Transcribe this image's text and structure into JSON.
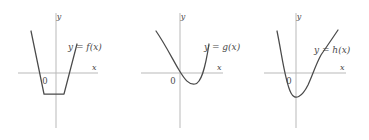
{
  "figure": {
    "name": "three-function-graphs",
    "background_color": "#ffffff",
    "axis_color": "#b9b9b9",
    "curve_color": "#4a4a4a",
    "panels": [
      {
        "id": "f",
        "function_label": "y = f(x)",
        "y_axis_label": "y",
        "x_axis_label": "x",
        "origin_label": "0",
        "curve_type": "piecewise-linear",
        "description": "Trapezoid-shaped piecewise linear graph: steep line descending from upper left to a flat horizontal segment below the x-axis, then rising steeply to the upper right.",
        "vertices": [
          {
            "x": -2.45,
            "y": 2.55
          },
          {
            "x": -1.05,
            "y": -1.35
          },
          {
            "x": 0.95,
            "y": -1.35
          },
          {
            "x": 2.2,
            "y": 1.75
          }
        ],
        "x_intercepts": [
          -1.55,
          1.45
        ],
        "minimum": {
          "x": -0.05,
          "y": -1.35
        }
      },
      {
        "id": "g",
        "function_label": "y = g(x)",
        "y_axis_label": "y",
        "x_axis_label": "x",
        "origin_label": "0",
        "curve_type": "smooth-convex",
        "description": "Smooth convex (parabola-like) curve descending from upper left, crossing the x-axis just left of the origin, reaching a shallow minimum below the axis, then rising steeply to the upper right.",
        "x_intercepts": [
          -0.1,
          1.35
        ],
        "minimum": {
          "x": 0.65,
          "y": -0.55
        }
      },
      {
        "id": "h",
        "function_label": "y = h(x)",
        "y_axis_label": "y",
        "x_axis_label": "x",
        "origin_label": "0",
        "curve_type": "smooth-s-shaped",
        "description": "S-shaped curve falling steeply from upper left, crossing the x-axis left of the origin, reaching a deep minimum, rising through an inflection point to the right of the origin, then climbing to the upper right.",
        "x_intercepts": [
          -1.55,
          0.75
        ],
        "minimum": {
          "x": -0.7,
          "y": -2.05
        },
        "inflection": {
          "x": 1.1,
          "y": 1.2
        }
      }
    ]
  }
}
